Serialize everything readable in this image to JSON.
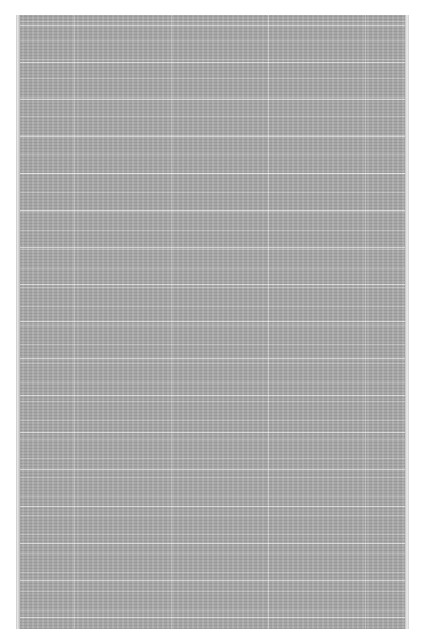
{
  "document": {
    "type": "scanned-page",
    "legible_text": ""
  },
  "colors": {
    "page_background": "#a9a9a9",
    "canvas_background": "#ffffff",
    "line_streaks": "#ffffff"
  }
}
